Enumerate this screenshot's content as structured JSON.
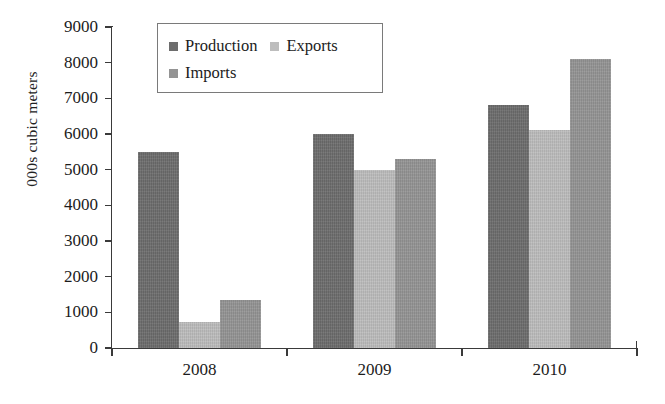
{
  "chart_data": {
    "type": "bar",
    "title": "",
    "subtitle": "",
    "xlabel": "",
    "ylabel": "000s cubic meters",
    "categories": [
      "2008",
      "2009",
      "2010"
    ],
    "series": [
      {
        "name": "Production",
        "color": "#6d6d6d",
        "values": [
          5500,
          6000,
          6800
        ]
      },
      {
        "name": "Exports",
        "color": "#bdbdbd",
        "values": [
          730,
          5000,
          6100
        ]
      },
      {
        "name": "Imports",
        "color": "#949494",
        "values": [
          1350,
          5300,
          8100
        ]
      }
    ],
    "ylim": [
      0,
      9000
    ],
    "ytick_values": [
      0,
      1000,
      2000,
      3000,
      4000,
      5000,
      6000,
      7000,
      8000,
      9000
    ],
    "ytick_labels": [
      "0",
      "1000",
      "2000",
      "3000",
      "4000",
      "5000",
      "6000",
      "7000",
      "8000",
      "9000"
    ],
    "grid": false,
    "legend_position": "top-left-inside",
    "legend_entries": [
      "Production",
      "Exports",
      "Imports"
    ]
  }
}
